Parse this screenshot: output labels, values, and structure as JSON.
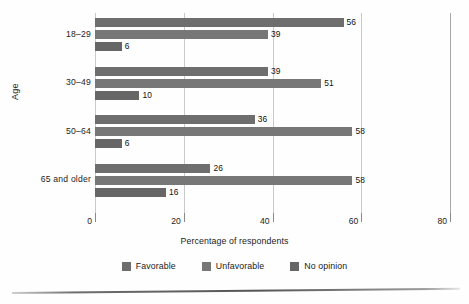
{
  "chart_data": {
    "type": "bar",
    "orientation": "horizontal",
    "title": "",
    "xlabel": "Percentage of respondents",
    "ylabel": "Age",
    "categories": [
      "18–29",
      "30–49",
      "50–64",
      "65 and older"
    ],
    "series": [
      {
        "name": "Favorable",
        "color": "#6e6e6e",
        "values": [
          56,
          39,
          36,
          26
        ]
      },
      {
        "name": "Unfavorable",
        "color": "#777777",
        "values": [
          39,
          51,
          58,
          58
        ]
      },
      {
        "name": "No opinion",
        "color": "#666666",
        "values": [
          6,
          10,
          6,
          16
        ]
      }
    ],
    "xlim": [
      0,
      80
    ],
    "xticks": [
      0,
      20,
      40,
      60,
      80
    ],
    "xtick_labels": [
      "0",
      "20",
      "40",
      "60",
      "80"
    ],
    "grid": true,
    "grid_axis": "x",
    "legend_position": "bottom",
    "data_labels": true
  },
  "legend": {
    "items": [
      {
        "label": "Favorable"
      },
      {
        "label": "Unfavorable"
      },
      {
        "label": "No opinion"
      }
    ]
  }
}
